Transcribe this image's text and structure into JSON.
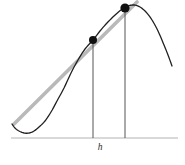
{
  "figure": {
    "kind": "secant-line-on-curve",
    "width": 185,
    "height": 165,
    "background_color": "#ffffff"
  },
  "labels": {
    "interval_label": "h"
  },
  "colors": {
    "curve": "#231f20",
    "secant": "#b9b9b9",
    "axis": "#b3b3b3",
    "vertical_lines": "#555555",
    "point_fill": "#111111",
    "label_text": "#2b2b2b",
    "background": "#ffffff"
  },
  "chart_data": {
    "type": "line",
    "title": "",
    "xlabel": "",
    "ylabel": "",
    "grid": false,
    "legend_position": "none",
    "axis": {
      "x_start_px": 11,
      "x_end_px": 178,
      "baseline_y_px": 138,
      "stroke_width": 1.1
    },
    "series": [
      {
        "name": "curve",
        "role": "function-graph",
        "stroke": "#231f20",
        "stroke_width": 1.3,
        "points_px": [
          [
            12,
            124
          ],
          [
            15,
            128
          ],
          [
            19,
            131
          ],
          [
            24,
            133
          ],
          [
            29,
            133
          ],
          [
            34,
            131
          ],
          [
            39,
            127
          ],
          [
            45,
            121
          ],
          [
            51,
            112
          ],
          [
            57,
            101
          ],
          [
            64,
            88
          ],
          [
            71,
            73
          ],
          [
            78,
            60
          ],
          [
            85,
            49
          ],
          [
            93,
            40
          ],
          [
            100,
            31
          ],
          [
            107,
            23
          ],
          [
            114,
            16
          ],
          [
            121,
            10
          ],
          [
            128,
            6
          ],
          [
            134,
            5
          ],
          [
            140,
            7
          ],
          [
            146,
            12
          ],
          [
            152,
            20
          ],
          [
            158,
            31
          ],
          [
            164,
            45
          ],
          [
            168,
            55
          ],
          [
            172,
            66
          ]
        ]
      },
      {
        "name": "secant",
        "role": "secant-line",
        "stroke": "#b9b9b9",
        "stroke_width": 3.6,
        "points_px": [
          [
            14,
            124
          ],
          [
            137,
            2
          ]
        ]
      }
    ],
    "marked_points": [
      {
        "name": "left-point",
        "x_px": 93,
        "y_px": 40,
        "radius_px": 4.0
      },
      {
        "name": "right-point",
        "x_px": 125,
        "y_px": 8,
        "radius_px": 4.6
      }
    ],
    "vertical_drop_lines": [
      {
        "name": "left-drop-line",
        "x_px": 93,
        "y_top_px": 40,
        "y_bottom_px": 138
      },
      {
        "name": "right-drop-line",
        "x_px": 125,
        "y_top_px": 8,
        "y_bottom_px": 138
      }
    ],
    "annotations": [
      {
        "name": "interval-label",
        "text": "h",
        "x_px": 100,
        "y_px": 143,
        "style": "italic"
      }
    ]
  }
}
